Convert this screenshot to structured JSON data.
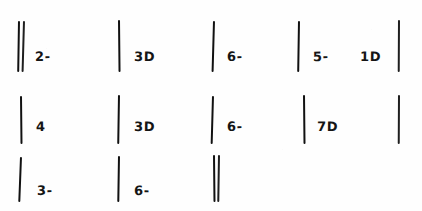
{
  "sheet": {
    "title": "Handwritten tally marks sheet",
    "background_color": "#fefefe",
    "ink_color": "#1a1a1a",
    "width": 422,
    "height": 211
  },
  "rows": [
    {
      "row_label": "row-1",
      "groups": [
        {
          "name": "group-1-1",
          "tally_count": "2",
          "label": "2-",
          "strokes": 2
        },
        {
          "name": "group-1-2",
          "tally_count": "1",
          "label": "3D",
          "strokes": 1
        },
        {
          "name": "group-1-3",
          "tally_count": "1",
          "label": "6-",
          "strokes": 1
        },
        {
          "name": "group-1-4",
          "tally_count": "1",
          "label": "5-",
          "strokes": 1
        },
        {
          "name": "group-1-5",
          "tally_count": "0",
          "label": "1D",
          "strokes": 0
        },
        {
          "name": "group-1-6",
          "tally_count": "1",
          "label": "",
          "strokes": 1
        }
      ]
    },
    {
      "row_label": "row-2",
      "groups": [
        {
          "name": "group-2-1",
          "tally_count": "1",
          "label": "4",
          "strokes": 1
        },
        {
          "name": "group-2-2",
          "tally_count": "1",
          "label": "3D",
          "strokes": 1
        },
        {
          "name": "group-2-3",
          "tally_count": "1",
          "label": "6-",
          "strokes": 1
        },
        {
          "name": "group-2-4",
          "tally_count": "1",
          "label": "7D",
          "strokes": 1
        },
        {
          "name": "group-2-5",
          "tally_count": "1",
          "label": "",
          "strokes": 1
        }
      ]
    },
    {
      "row_label": "row-3",
      "groups": [
        {
          "name": "group-3-1",
          "tally_count": "1",
          "label": "3-",
          "strokes": 1
        },
        {
          "name": "group-3-2",
          "tally_count": "1",
          "label": "6-",
          "strokes": 1
        },
        {
          "name": "group-3-3",
          "tally_count": "2",
          "label": "",
          "strokes": 2
        }
      ]
    }
  ],
  "labels": {
    "r1c1": "2-",
    "r1c2": "3D",
    "r1c3": "6-",
    "r1c4": "5-",
    "r1c5": "1D",
    "r2c1": "4",
    "r2c2": "3D",
    "r2c3": "6-",
    "r2c4": "7D",
    "r3c1": "3-",
    "r3c2": "6-"
  }
}
